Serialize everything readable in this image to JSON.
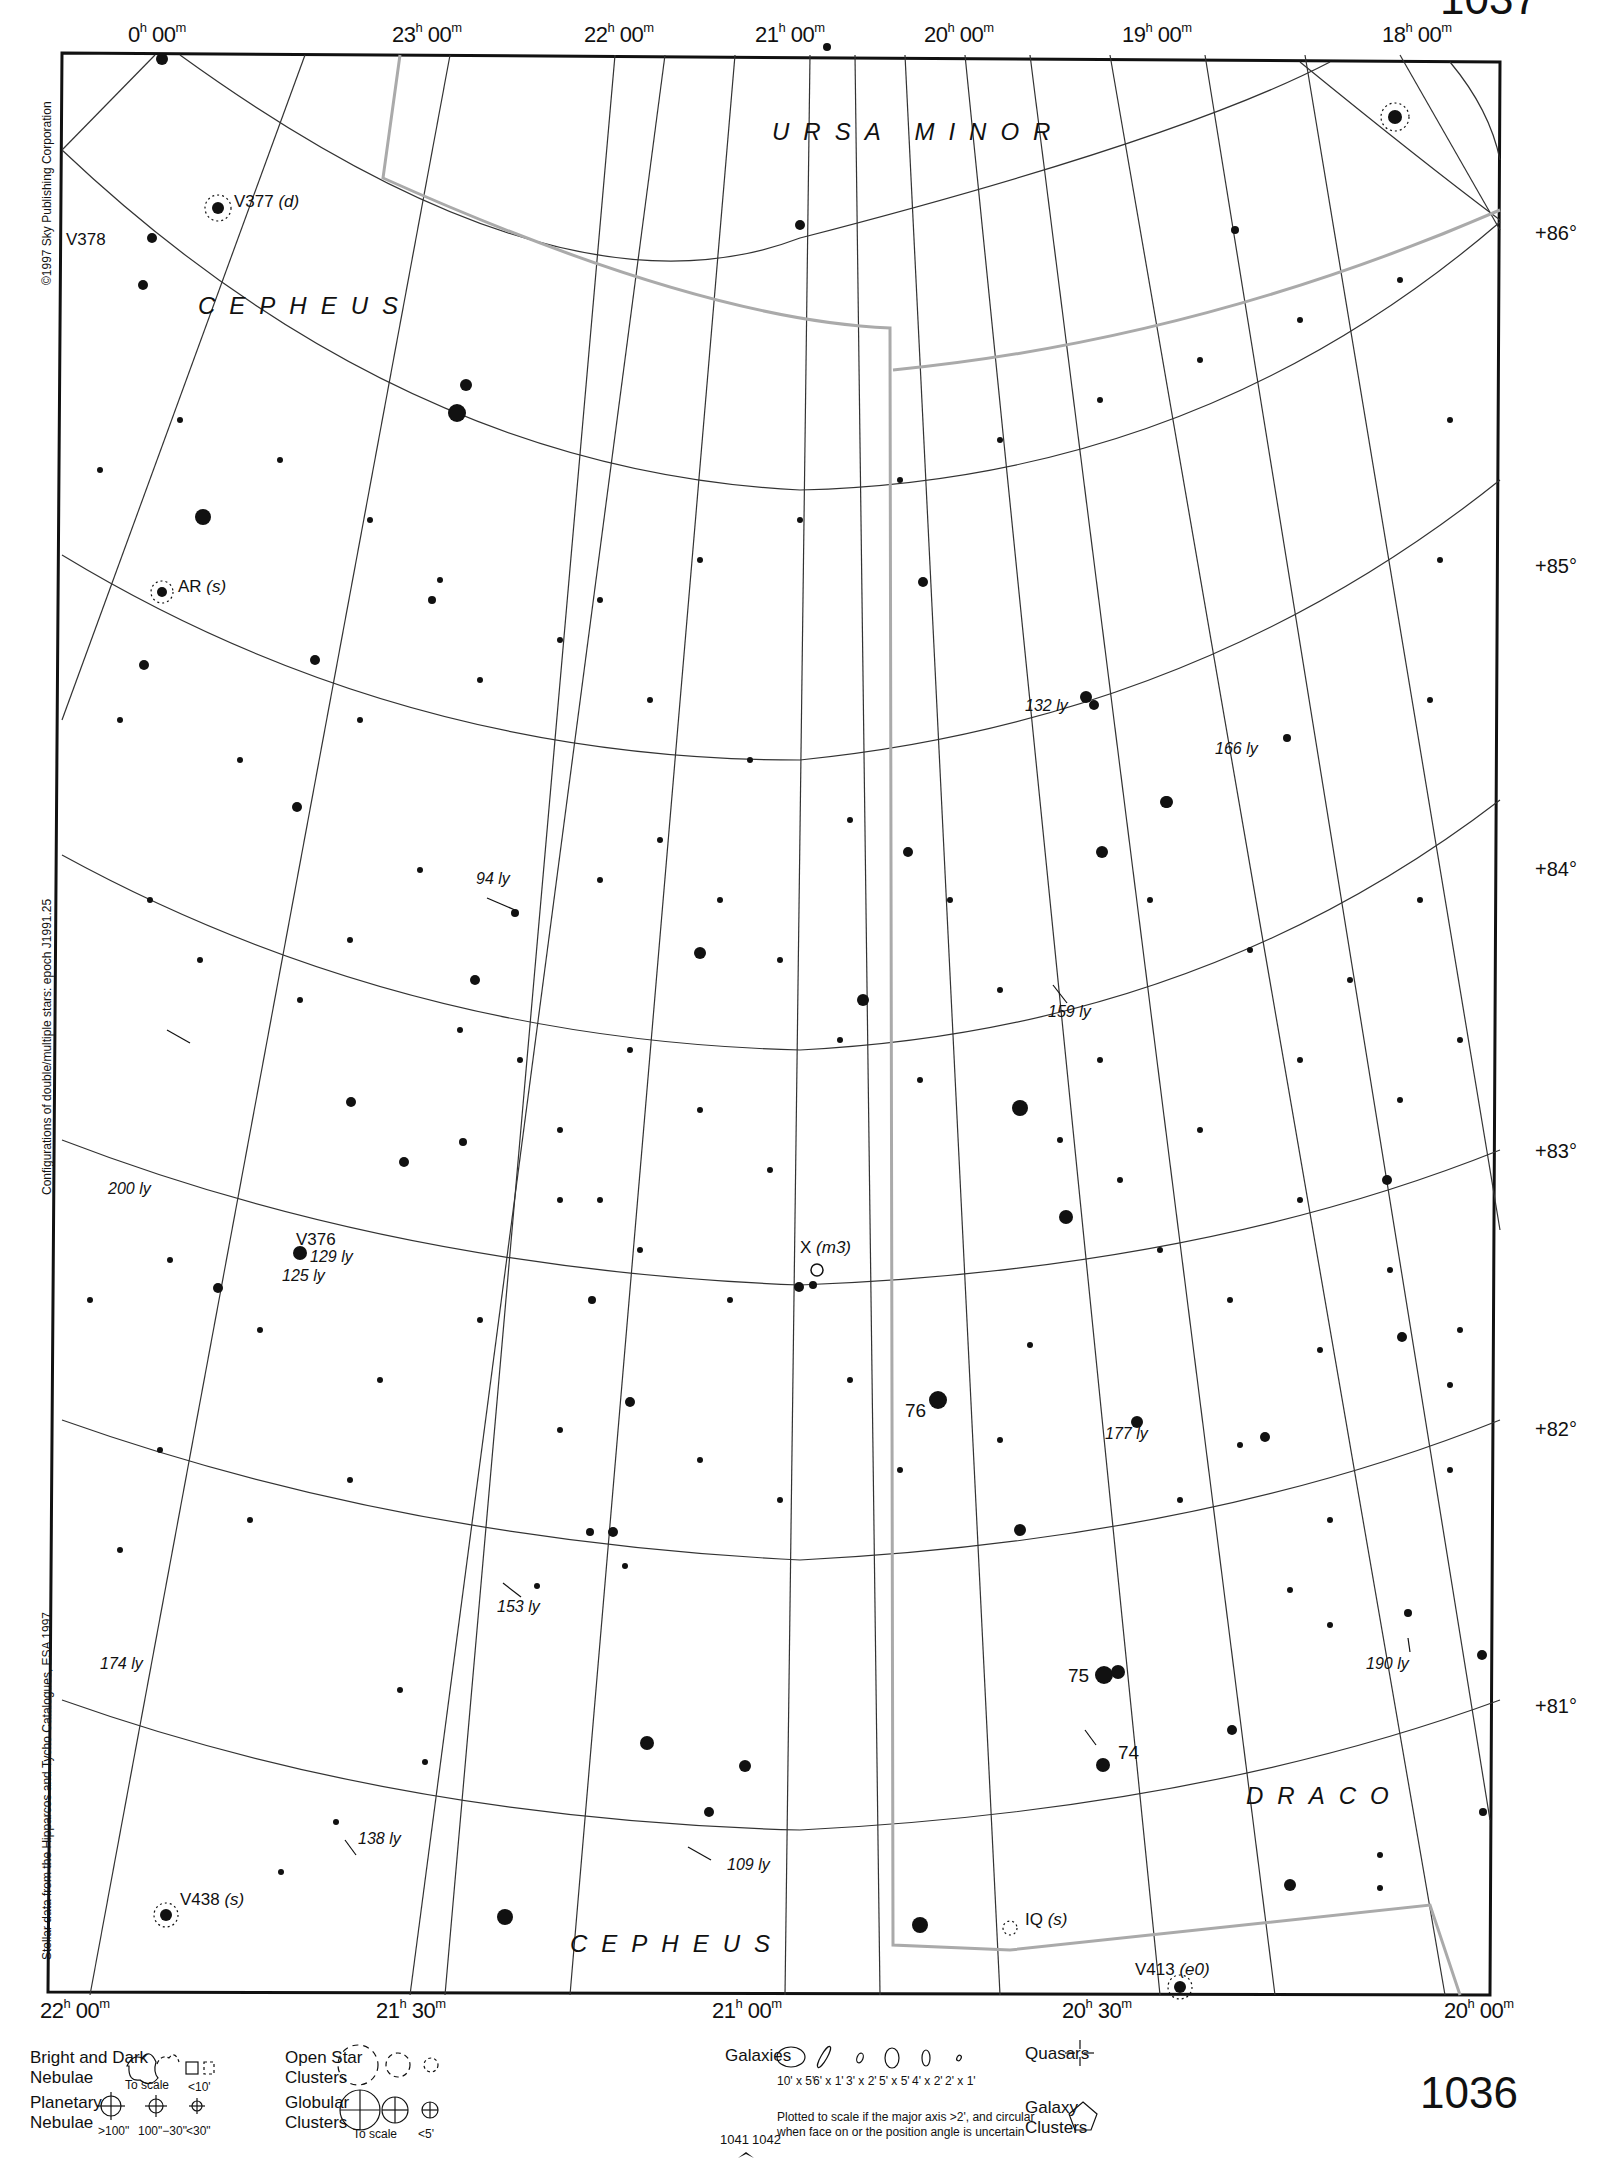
{
  "page": {
    "number": "1036",
    "top_page_fragment": "1037",
    "nav_left": "1041",
    "nav_right": "1042"
  },
  "ra_top": [
    {
      "h": "0",
      "m": "00",
      "x": 128
    },
    {
      "h": "23",
      "m": "00",
      "x": 392
    },
    {
      "h": "22",
      "m": "00",
      "x": 584
    },
    {
      "h": "21",
      "m": "00",
      "x": 755
    },
    {
      "h": "20",
      "m": "00",
      "x": 924
    },
    {
      "h": "19",
      "m": "00",
      "x": 1122
    },
    {
      "h": "18",
      "m": "00",
      "x": 1382
    }
  ],
  "ra_bottom": [
    {
      "h": "22",
      "m": "00",
      "x": 40
    },
    {
      "h": "21",
      "m": "30",
      "x": 376
    },
    {
      "h": "21",
      "m": "00",
      "x": 712
    },
    {
      "h": "20",
      "m": "30",
      "x": 1062
    },
    {
      "h": "20",
      "m": "00",
      "x": 1444
    }
  ],
  "declination": [
    {
      "label": "+86°",
      "y": 222
    },
    {
      "label": "+85°",
      "y": 555
    },
    {
      "label": "+84°",
      "y": 858
    },
    {
      "label": "+83°",
      "y": 1150
    },
    {
      "label": "+82°",
      "y": 1428
    },
    {
      "label": "+81°",
      "y": 1705
    }
  ],
  "constellations": [
    {
      "name": "URSA MINOR",
      "x": 772,
      "y": 118
    },
    {
      "name": "CEPHEUS",
      "x": 198,
      "y": 292
    },
    {
      "name": "CEPHEUS",
      "x": 570,
      "y": 1930
    },
    {
      "name": "DRACO",
      "x": 1246,
      "y": 1782
    }
  ],
  "star_labels": [
    {
      "name": "V377",
      "note": "(d)",
      "x": 234,
      "y": 192
    },
    {
      "name": "V378",
      "note": "",
      "x": 66,
      "y": 230
    },
    {
      "name": "AR",
      "note": "(s)",
      "x": 178,
      "y": 577
    },
    {
      "name": "V376",
      "note": "",
      "x": 296,
      "y": 1230
    },
    {
      "name": "X",
      "note": "(m3)",
      "x": 800,
      "y": 1240
    },
    {
      "name": "IQ",
      "note": "(s)",
      "x": 1025,
      "y": 1912
    },
    {
      "name": "V413",
      "note": "(e0)",
      "x": 1135,
      "y": 1962
    },
    {
      "name": "V438",
      "note": "(s)",
      "x": 180,
      "y": 1892
    }
  ],
  "distances": [
    {
      "text": "132 ly",
      "x": 1025,
      "y": 700
    },
    {
      "text": "166 ly",
      "x": 1215,
      "y": 742
    },
    {
      "text": "94 ly",
      "x": 476,
      "y": 872
    },
    {
      "text": "159 ly",
      "x": 1048,
      "y": 1005
    },
    {
      "text": "200 ly",
      "x": 108,
      "y": 1180
    },
    {
      "text": "129 ly",
      "x": 310,
      "y": 1252
    },
    {
      "text": "125 ly",
      "x": 282,
      "y": 1267
    },
    {
      "text": "177 ly",
      "x": 1105,
      "y": 1427
    },
    {
      "text": "153 ly",
      "x": 497,
      "y": 1600
    },
    {
      "text": "174 ly",
      "x": 100,
      "y": 1657
    },
    {
      "text": "190 ly",
      "x": 1366,
      "y": 1656
    },
    {
      "text": "138 ly",
      "x": 358,
      "y": 1832
    },
    {
      "text": "109 ly",
      "x": 727,
      "y": 1858
    }
  ],
  "numbered_stars": [
    {
      "text": "76",
      "x": 905,
      "y": 1405
    },
    {
      "text": "75",
      "x": 1068,
      "y": 1668
    },
    {
      "text": "74",
      "x": 1118,
      "y": 1747
    }
  ],
  "side_notes": {
    "copyright": "©1997 Sky Publishing Corporation",
    "epoch": "Configurations of double/multiple stars: epoch J1991.25",
    "source": "Stellar data from the Hipparcos and Tycho Catalogues, ESA 1997"
  },
  "legend": {
    "nebulae": {
      "title1": "Bright and Dark",
      "title2": "Nebulae",
      "to_scale": "To scale",
      "small": "<10'"
    },
    "planetary": {
      "title1": "Planetary",
      "title2": "Nebulae",
      "sizes": [
        ">100\"",
        "100\"−30\"",
        "<30\""
      ]
    },
    "open_clusters": {
      "title1": "Open Star",
      "title2": "Clusters"
    },
    "globular": {
      "title1": "Globular",
      "title2": "Clusters",
      "to_scale": "To scale",
      "small": "<5'"
    },
    "galaxies": {
      "title": "Galaxies",
      "sizes": [
        "10' x 5'",
        "6' x 1'",
        "3' x 2'",
        "5' x 5'",
        "4' x 2'",
        "2' x 1'"
      ],
      "note1": "Plotted to scale if the major axis >2', and circular",
      "note2": "when face on or the position angle is uncertain"
    },
    "quasars": {
      "title": "Quasars"
    },
    "galaxy_clusters": {
      "title1": "Galaxy",
      "title2": "Clusters"
    }
  }
}
